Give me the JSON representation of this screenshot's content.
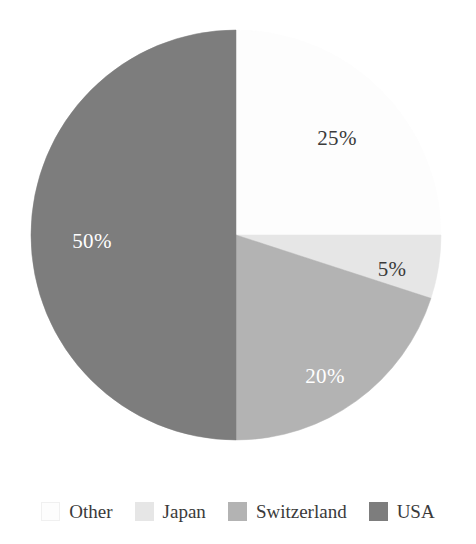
{
  "chart_data": {
    "type": "pie",
    "title": "",
    "labels": [
      "Other",
      "Japan",
      "Switzerland",
      "USA"
    ],
    "values": [
      25,
      5,
      20,
      50
    ],
    "value_labels": [
      "25%",
      "5%",
      "20%",
      "50%"
    ],
    "colors": [
      "#fdfdfd",
      "#e6e6e6",
      "#b3b3b3",
      "#7d7d7d"
    ],
    "label_text_colors": [
      "#3a3a3a",
      "#3a3a3a",
      "#ffffff",
      "#ffffff"
    ],
    "units": "percent",
    "start_angle_deg": 0,
    "direction": "clockwise",
    "legend_position": "bottom",
    "grid": false
  },
  "pie": {
    "center_x": 236,
    "center_y": 235,
    "radius": 205,
    "slices": [
      {
        "name": "Other",
        "percent": 25,
        "value_label": "25%",
        "color": "#fdfdfd",
        "text_color": "#3a3a3a",
        "start_deg": 0,
        "end_deg": 90,
        "label_x": 337,
        "label_y": 140
      },
      {
        "name": "Japan",
        "percent": 5,
        "value_label": "5%",
        "color": "#e6e6e6",
        "text_color": "#3a3a3a",
        "start_deg": 90,
        "end_deg": 108,
        "label_x": 392,
        "label_y": 271
      },
      {
        "name": "Switzerland",
        "percent": 20,
        "value_label": "20%",
        "color": "#b3b3b3",
        "text_color": "#ffffff",
        "start_deg": 108,
        "end_deg": 180,
        "label_x": 325,
        "label_y": 378
      },
      {
        "name": "USA",
        "percent": 50,
        "value_label": "50%",
        "color": "#7d7d7d",
        "text_color": "#ffffff",
        "start_deg": 180,
        "end_deg": 360,
        "label_x": 92,
        "label_y": 243
      }
    ]
  },
  "legend": {
    "items": [
      {
        "label": "Other",
        "color": "#fdfdfd",
        "border": "#f0f0f0"
      },
      {
        "label": "Japan",
        "color": "#e6e6e6",
        "border": "#e6e6e6"
      },
      {
        "label": "Switzerland",
        "color": "#b3b3b3",
        "border": "#b3b3b3"
      },
      {
        "label": "USA",
        "color": "#7d7d7d",
        "border": "#7d7d7d"
      }
    ]
  }
}
